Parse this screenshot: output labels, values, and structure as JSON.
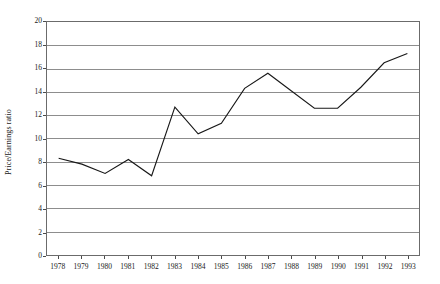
{
  "chart_data": {
    "type": "line",
    "title": "",
    "subtitle": "",
    "xlabel": "",
    "ylabel": "Price/Earnings ratio",
    "categories": [
      "1978",
      "1979",
      "1980",
      "1981",
      "1982",
      "1983",
      "1984",
      "1985",
      "1986",
      "1987",
      "1988",
      "1989",
      "1990",
      "1991",
      "1992",
      "1993"
    ],
    "x": [
      1978,
      1979,
      1980,
      1981,
      1982,
      1983,
      1984,
      1985,
      1986,
      1987,
      1988,
      1989,
      1990,
      1991,
      1992,
      1993
    ],
    "values": [
      8.3,
      7.8,
      7.0,
      8.2,
      6.8,
      12.7,
      10.4,
      11.3,
      14.3,
      15.6,
      14.1,
      12.6,
      12.6,
      14.4,
      16.5,
      17.3
    ],
    "series": [
      {
        "name": "Price/Earnings ratio",
        "values": [
          8.3,
          7.8,
          7.0,
          8.2,
          6.8,
          12.7,
          10.4,
          11.3,
          14.3,
          15.6,
          14.1,
          12.6,
          12.6,
          14.4,
          16.5,
          17.3
        ]
      }
    ],
    "ylim": [
      0,
      20
    ],
    "yticks": [
      0,
      2,
      4,
      6,
      8,
      10,
      12,
      14,
      16,
      18,
      20
    ],
    "ytick_labels": [
      "0",
      "2",
      "4",
      "6",
      "8",
      "10",
      "12",
      "14",
      "16",
      "18",
      "20"
    ],
    "xtick_labels": [
      "1978",
      "1979",
      "1980",
      "1981",
      "1982",
      "1983",
      "1984",
      "1985",
      "1986",
      "1987",
      "1988",
      "1989",
      "1990",
      "1991",
      "1992",
      "1993"
    ],
    "grid": "horizontal",
    "legend": "none",
    "line_color": "#181818",
    "grid_color": "#8c8c8c",
    "axis_color": "#6b6b6b",
    "background": "#ffffff",
    "annotations": []
  }
}
